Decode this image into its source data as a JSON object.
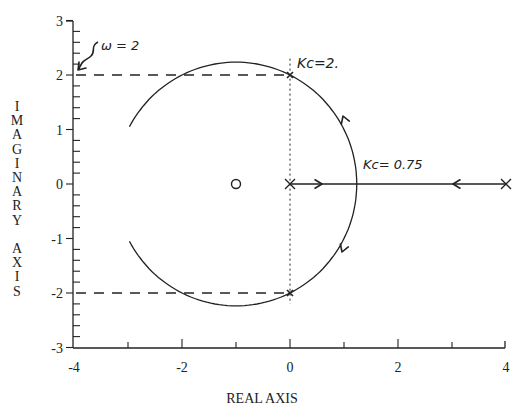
{
  "figure": {
    "xlabel": "REAL AXIS",
    "ylabel": "IMAGINARY AXIS",
    "xticks": [
      {
        "value": -4,
        "label": "-4"
      },
      {
        "value": -2,
        "label": "-2"
      },
      {
        "value": 0,
        "label": "0"
      },
      {
        "value": 2,
        "label": "2"
      },
      {
        "value": 4,
        "label": "4"
      }
    ],
    "yticks": [
      {
        "value": 3,
        "label": "3"
      },
      {
        "value": 2,
        "label": "2"
      },
      {
        "value": 1,
        "label": "1"
      },
      {
        "value": 0,
        "label": "0"
      },
      {
        "value": -1,
        "label": "-1"
      },
      {
        "value": -2,
        "label": "-2"
      },
      {
        "value": -3,
        "label": "-3"
      }
    ],
    "annotations": {
      "omega": "ω = 2",
      "kc_upper": "Kc=2.",
      "kc_breakaway": "Kc= 0.75"
    },
    "colors": {
      "ink": "#222222",
      "background": "#ffffff"
    }
  },
  "chart_data": {
    "type": "root-locus",
    "title": "",
    "xlabel": "REAL AXIS",
    "ylabel": "IMAGINARY AXIS",
    "xlim": [
      -4,
      4
    ],
    "ylim": [
      -3,
      3
    ],
    "poles": [
      [
        0,
        0
      ],
      [
        4,
        0
      ]
    ],
    "zeros": [
      [
        -1,
        0
      ]
    ],
    "real_axis_segment": {
      "from": 0,
      "to": 4,
      "arrows": "pointing toward breakaway ≈ 1.24"
    },
    "circle_branch": {
      "center": [
        -1,
        0
      ],
      "radius": 2.236,
      "drawn_from_deg": 27,
      "drawn_to_deg": 153,
      "note": "arcs end near (-3, ±1)"
    },
    "breakaway_point": {
      "x": 1.24,
      "y": 0,
      "label": "Kc = 0.75"
    },
    "imag_axis_crossings": [
      {
        "x": 0,
        "y": 2,
        "label": "Kc = 2"
      },
      {
        "x": 0,
        "y": -2
      }
    ],
    "guide_lines": [
      {
        "type": "dashed",
        "y": 2,
        "x_from": -4,
        "x_to": 0
      },
      {
        "type": "dashed",
        "y": -2,
        "x_from": -4,
        "x_to": 0
      },
      {
        "type": "dotted",
        "x": 0,
        "y_from": -2.2,
        "y_to": 2.3
      }
    ],
    "annotations": [
      "ω = 2",
      "Kc = 2.",
      "Kc = 0.75"
    ]
  }
}
